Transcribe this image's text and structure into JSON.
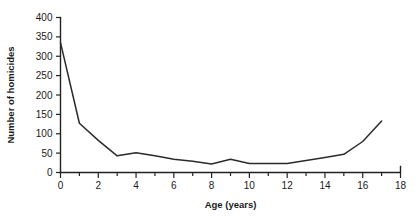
{
  "chart_data": {
    "type": "line",
    "title": "",
    "xlabel": "Age (years)",
    "ylabel": "Number of homicides",
    "xlim": [
      0,
      18
    ],
    "ylim": [
      0,
      400
    ],
    "grid": false,
    "legend": "none",
    "x_ticks": [
      0,
      1,
      2,
      3,
      4,
      5,
      6,
      7,
      8,
      9,
      10,
      11,
      12,
      13,
      14,
      15,
      16,
      17,
      18
    ],
    "x_tick_labels": [
      "0",
      "",
      "2",
      "",
      "4",
      "",
      "6",
      "",
      "8",
      "",
      "10",
      "",
      "12",
      "",
      "14",
      "",
      "16",
      "",
      "18"
    ],
    "y_ticks": [
      0,
      50,
      100,
      150,
      200,
      250,
      300,
      350,
      400
    ],
    "y_tick_labels": [
      "0",
      "50",
      "100",
      "150",
      "200",
      "250",
      "300",
      "350",
      "400"
    ],
    "x": [
      0,
      1,
      2,
      3,
      4,
      5,
      6,
      7,
      8,
      9,
      10,
      11,
      12,
      13,
      14,
      15,
      16,
      17
    ],
    "values": [
      335,
      127,
      83,
      43,
      51,
      43,
      34,
      29,
      22,
      34,
      23,
      23,
      23,
      31,
      39,
      47,
      80,
      133
    ],
    "series_name": "Number of homicides",
    "line_color": "#2b2b2b",
    "background_color": "#ffffff"
  },
  "axes": {
    "x_axis_title": "Age (years)",
    "y_axis_title": "Number of homicides"
  }
}
